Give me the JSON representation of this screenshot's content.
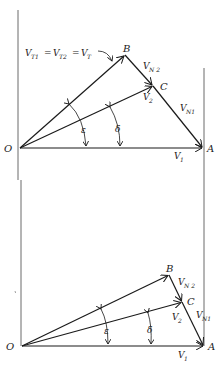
{
  "figure": {
    "top": {
      "points": {
        "O": {
          "label": "O",
          "x": 20,
          "y": 148
        },
        "A": {
          "label": "A",
          "x": 203,
          "y": 148
        },
        "B": {
          "label": "B",
          "x": 125,
          "y": 55
        },
        "C": {
          "label": "C",
          "x": 153,
          "y": 86
        }
      },
      "labels": {
        "vt_main": "V",
        "vt_eq": "T1 = V",
        "vt_text": "V_T1 = V_T2 = V_T",
        "VN2": "V_N2",
        "VN1": "V_N1",
        "V2": "V_2",
        "V1": "V_1",
        "epsilon": "ε",
        "delta": "δ"
      }
    },
    "bottom": {
      "points": {
        "O": {
          "label": "O",
          "x": 22,
          "y": 346
        },
        "A": {
          "label": "A",
          "x": 204,
          "y": 346
        },
        "B": {
          "label": "B",
          "x": 169,
          "y": 275
        },
        "C": {
          "label": "C",
          "x": 182,
          "y": 302
        }
      },
      "labels": {
        "VN2": "V_N2",
        "VN1": "V_N1",
        "V2": "V_2",
        "V1": "V_1",
        "epsilon": "ε",
        "delta": "δ"
      }
    },
    "text": {
      "V": "V",
      "T1": "T1",
      "T2": "T2",
      "T": "T",
      "eq": "=",
      "N2": "N 2",
      "N1": "N1",
      "two": "2",
      "one": "1",
      "O": "O",
      "A": "A",
      "B": "B",
      "C": "C",
      "epsilon": "ε",
      "delta": "δ"
    }
  }
}
